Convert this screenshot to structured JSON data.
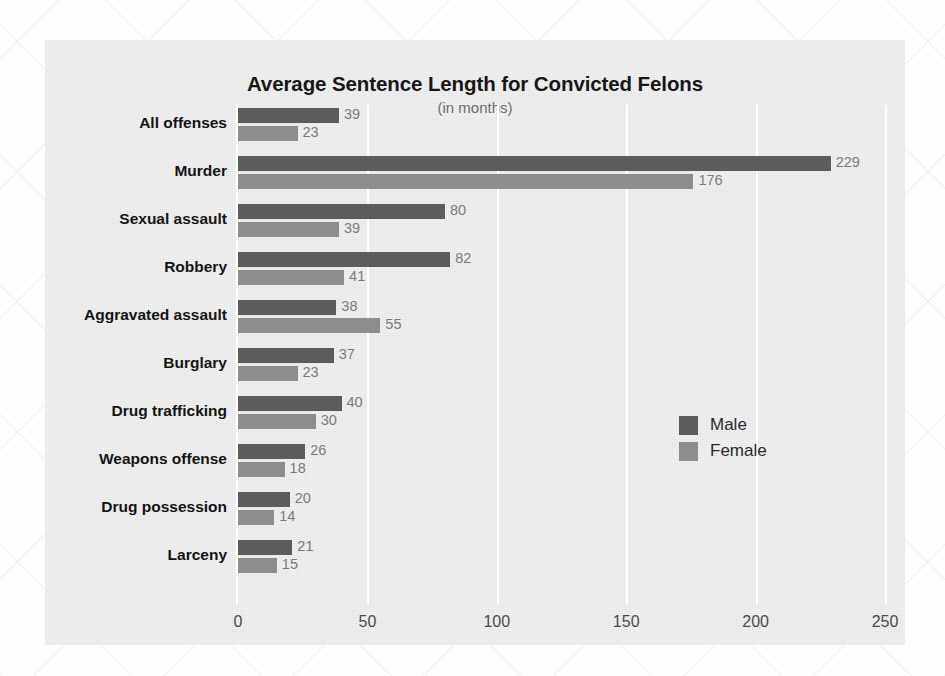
{
  "chart_data": {
    "type": "bar",
    "orientation": "horizontal",
    "title": "Average Sentence Length for Convicted Felons",
    "subtitle": "(in months)",
    "xlabel": "",
    "ylabel": "",
    "xlim": [
      0,
      250
    ],
    "xticks": [
      0,
      50,
      100,
      150,
      200,
      250
    ],
    "grid": true,
    "legend_position": "center-right",
    "categories": [
      "All offenses",
      "Murder",
      "Sexual assault",
      "Robbery",
      "Aggravated assault",
      "Burglary",
      "Drug trafficking",
      "Weapons offense",
      "Drug possession",
      "Larceny"
    ],
    "series": [
      {
        "name": "Male",
        "color": "#5c5c5c",
        "values": [
          39,
          229,
          80,
          82,
          38,
          37,
          40,
          26,
          20,
          21
        ]
      },
      {
        "name": "Female",
        "color": "#8d8d8d",
        "values": [
          23,
          176,
          39,
          41,
          55,
          23,
          30,
          18,
          14,
          15
        ]
      }
    ]
  },
  "colors": {
    "male": "#5c5c5c",
    "female": "#8d8d8d",
    "panel_background": "#e6e6e6",
    "gridline": "#ffffff",
    "title_text": "#171717",
    "subtitle_text": "#6e6e6e",
    "value_label_text": "#7b7b7b",
    "category_label_text": "#141414",
    "tick_text": "#4a4a4a"
  }
}
